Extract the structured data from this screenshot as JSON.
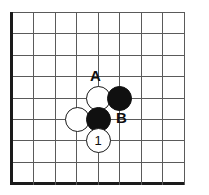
{
  "figure": {
    "kind": "go-board-diagram",
    "cropped_header_text": "",
    "width_px": 209,
    "height_px": 195
  },
  "board": {
    "line_color": "#5a5a5a",
    "edge_color": "#1a1a1a",
    "background_color": "#ffffff",
    "cell_size_px": 21.4,
    "origin_x_px": 11,
    "origin_y_px": 12,
    "columns": 9,
    "rows": 9,
    "edges_drawn": [
      "left",
      "bottom"
    ],
    "vertical_line_x": [
      11,
      33,
      55,
      76,
      98,
      119,
      141,
      162,
      184
    ],
    "horizontal_line_y": [
      12,
      33,
      55,
      76,
      98,
      119,
      140,
      162,
      183
    ]
  },
  "stones": [
    {
      "id": "w-a5",
      "color": "white",
      "cx": 98,
      "cy": 98,
      "r": 12.5,
      "number": ""
    },
    {
      "id": "b-b5",
      "color": "black",
      "cx": 119,
      "cy": 98,
      "r": 12.5,
      "number": ""
    },
    {
      "id": "w-left",
      "color": "white",
      "cx": 77,
      "cy": 119,
      "r": 12.5,
      "number": ""
    },
    {
      "id": "b-b6",
      "color": "black",
      "cx": 98,
      "cy": 119,
      "r": 12.5,
      "number": ""
    },
    {
      "id": "w-move1",
      "color": "white",
      "cx": 98,
      "cy": 140,
      "r": 12.5,
      "number": "1"
    }
  ],
  "point_labels": [
    {
      "id": "label-a",
      "text": "A",
      "x": 90,
      "y": 68
    },
    {
      "id": "label-b",
      "text": "B",
      "x": 116,
      "y": 110
    }
  ]
}
